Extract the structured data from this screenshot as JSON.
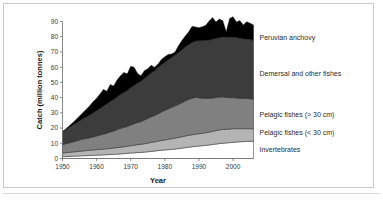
{
  "chart_data": {
    "type": "area",
    "title": "",
    "xlabel": "Year",
    "ylabel": "Catch (million tonnes)",
    "xlim": [
      1950,
      2006
    ],
    "ylim": [
      0,
      90
    ],
    "grid": false,
    "legend_position": "right-inline",
    "stacked": true,
    "xticks": [
      1950,
      1960,
      1970,
      1980,
      1990,
      2000
    ],
    "yticks": [
      0,
      10,
      20,
      30,
      40,
      50,
      60,
      70,
      80,
      90
    ],
    "x": [
      1950,
      1951,
      1952,
      1953,
      1954,
      1955,
      1956,
      1957,
      1958,
      1959,
      1960,
      1961,
      1962,
      1963,
      1964,
      1965,
      1966,
      1967,
      1968,
      1969,
      1970,
      1971,
      1972,
      1973,
      1974,
      1975,
      1976,
      1977,
      1978,
      1979,
      1980,
      1981,
      1982,
      1983,
      1984,
      1985,
      1986,
      1987,
      1988,
      1989,
      1990,
      1991,
      1992,
      1993,
      1994,
      1995,
      1996,
      1997,
      1998,
      1999,
      2000,
      2001,
      2002,
      2003,
      2004,
      2005,
      2006
    ],
    "series": [
      {
        "name": "Invertebrates",
        "color": "#ffffff",
        "values": [
          1.2,
          1.3,
          1.4,
          1.5,
          1.6,
          1.7,
          1.8,
          1.9,
          2.0,
          2.1,
          2.2,
          2.3,
          2.4,
          2.5,
          2.6,
          2.7,
          2.9,
          3.0,
          3.2,
          3.4,
          3.6,
          3.7,
          3.9,
          4.0,
          4.2,
          4.4,
          4.7,
          4.9,
          5.2,
          5.4,
          5.6,
          5.8,
          6.0,
          6.2,
          6.5,
          6.8,
          7.1,
          7.4,
          7.7,
          8.0,
          8.2,
          8.4,
          8.6,
          8.9,
          9.2,
          9.5,
          9.8,
          10.0,
          10.2,
          10.4,
          10.6,
          10.8,
          11.0,
          11.1,
          11.2,
          11.3,
          11.3
        ]
      },
      {
        "name": "Pelagic fishes (< 30 cm)",
        "color": "#b4b4b4",
        "values": [
          2.4,
          2.5,
          2.6,
          2.8,
          2.9,
          3.0,
          3.2,
          3.3,
          3.4,
          3.5,
          3.6,
          3.7,
          3.8,
          3.9,
          4.0,
          4.2,
          4.3,
          4.4,
          4.5,
          4.6,
          4.8,
          5.0,
          5.2,
          5.3,
          5.5,
          5.7,
          5.9,
          6.0,
          6.2,
          6.4,
          6.6,
          6.8,
          7.0,
          7.2,
          7.3,
          7.5,
          7.7,
          7.8,
          7.9,
          8.0,
          8.1,
          8.2,
          8.3,
          8.4,
          8.6,
          8.8,
          9.0,
          9.1,
          9.0,
          8.9,
          9.0,
          8.8,
          8.6,
          8.5,
          8.4,
          8.3,
          8.2
        ]
      },
      {
        "name": "Pelagic fishes (> 30 cm)",
        "color": "#808080",
        "values": [
          5.5,
          6.0,
          6.3,
          6.6,
          7.0,
          7.4,
          7.8,
          8.0,
          8.3,
          8.6,
          9.0,
          9.4,
          9.8,
          10.2,
          10.8,
          11.2,
          11.8,
          12.4,
          12.8,
          13.0,
          13.6,
          14.2,
          14.6,
          15.0,
          15.6,
          16.2,
          16.8,
          17.4,
          18.0,
          18.8,
          19.4,
          20.0,
          20.6,
          21.2,
          21.8,
          22.4,
          23.0,
          23.6,
          24.0,
          24.2,
          23.6,
          23.0,
          22.6,
          22.2,
          22.0,
          21.8,
          21.6,
          21.4,
          21.0,
          20.6,
          20.4,
          20.2,
          20.0,
          19.9,
          19.8,
          19.7,
          19.6
        ]
      },
      {
        "name": "Demersal and other fishes",
        "color": "#3c3c3c",
        "values": [
          8.4,
          9.2,
          10.2,
          11.0,
          11.8,
          12.6,
          13.4,
          14.0,
          14.8,
          15.8,
          16.6,
          17.4,
          18.4,
          19.2,
          20.0,
          20.6,
          21.4,
          22.2,
          23.0,
          23.6,
          24.4,
          25.0,
          25.8,
          26.4,
          27.2,
          28.0,
          28.8,
          29.4,
          30.2,
          31.0,
          31.6,
          32.2,
          32.8,
          33.4,
          34.0,
          34.6,
          35.4,
          36.0,
          36.6,
          37.0,
          37.4,
          37.8,
          38.0,
          38.2,
          38.6,
          38.8,
          39.0,
          39.2,
          39.4,
          39.6,
          39.8,
          39.6,
          39.4,
          39.2,
          39.0,
          38.8,
          38.6
        ]
      },
      {
        "name": "Peruvian anchovy",
        "color": "#000000",
        "values": [
          0.2,
          0.5,
          1.0,
          1.6,
          2.4,
          3.2,
          4.0,
          5.2,
          6.2,
          7.4,
          8.2,
          9.6,
          11.0,
          8.4,
          11.2,
          9.0,
          11.2,
          12.4,
          13.0,
          11.0,
          14.2,
          12.0,
          6.4,
          3.6,
          5.2,
          4.6,
          5.0,
          2.2,
          2.4,
          3.4,
          3.6,
          3.6,
          2.2,
          2.0,
          4.4,
          6.2,
          7.2,
          8.4,
          10.6,
          9.2,
          8.6,
          9.2,
          10.0,
          12.6,
          14.2,
          10.8,
          12.2,
          10.8,
          3.6,
          12.4,
          13.4,
          10.2,
          11.6,
          9.0,
          11.4,
          10.8,
          10.0
        ]
      }
    ],
    "legend_entries": [
      {
        "label": "Peruvian anchovy",
        "color": "#000000",
        "y": 40
      },
      {
        "label": "Demersal and other fishes",
        "color": "#3c3c3c",
        "y": 76
      },
      {
        "label": "Pelagic fishes (> 30 cm)",
        "color": "#808080",
        "y": 117
      },
      {
        "label": "Pelagic fishes (< 30 cm)",
        "color": "#b4b4b4",
        "y": 135
      },
      {
        "label": "Invertebrates",
        "color": "#ffffff",
        "y": 152
      }
    ]
  },
  "axis": {
    "y_title": "Catch (million tonnes)",
    "x_title": "Year",
    "y_ticks": [
      "90",
      "80",
      "70",
      "60",
      "50",
      "40",
      "30",
      "20",
      "10",
      "0"
    ],
    "x_ticks": [
      "1950",
      "1960",
      "1970",
      "1980",
      "1990",
      "2000"
    ]
  },
  "legend": {
    "items": [
      "Peruvian anchovy",
      "Demersal and other fishes",
      "Pelagic fishes (> 30 cm)",
      "Pelagic fishes (< 30 cm)",
      "Invertebrates"
    ]
  }
}
